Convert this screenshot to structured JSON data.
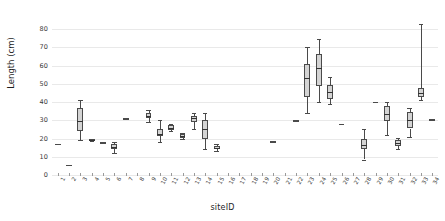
{
  "chart_data": {
    "type": "boxplot",
    "title": "",
    "xlabel": "siteID",
    "ylabel": "Length (cm)",
    "ylim": [
      0,
      85
    ],
    "yticks": [
      0,
      10,
      20,
      30,
      40,
      50,
      60,
      70,
      80
    ],
    "grid": true,
    "legend": null,
    "categories": [
      "1",
      "2",
      "3",
      "4",
      "5",
      "6",
      "7",
      "8",
      "9",
      "10",
      "11",
      "12",
      "13",
      "14",
      "15",
      "16",
      "17",
      "18",
      "19",
      "20",
      "21",
      "22",
      "23",
      "24",
      "25",
      "26",
      "27",
      "28",
      "29",
      "30",
      "31",
      "32",
      "33",
      "34"
    ],
    "boxes": [
      {
        "site": "1",
        "min": 17.0,
        "q1": 17.0,
        "median": 17.0,
        "q3": 17.0,
        "max": 17.0,
        "single": true
      },
      {
        "site": "2",
        "min": 5.5,
        "q1": 5.5,
        "median": 5.5,
        "q3": 5.5,
        "max": 5.5,
        "single": true
      },
      {
        "site": "3",
        "min": 19.0,
        "q1": 24.0,
        "median": 29.5,
        "q3": 36.5,
        "max": 41.0,
        "single": false
      },
      {
        "site": "4",
        "min": 18.5,
        "q1": 18.5,
        "median": 19.0,
        "q3": 19.5,
        "max": 19.5,
        "single": false
      },
      {
        "site": "5",
        "min": 18.0,
        "q1": 18.0,
        "median": 18.0,
        "q3": 18.0,
        "max": 18.0,
        "single": true
      },
      {
        "site": "6",
        "min": 12.0,
        "q1": 14.0,
        "median": 15.5,
        "q3": 17.0,
        "max": 18.0,
        "single": false
      },
      {
        "site": "7",
        "min": 31.0,
        "q1": 31.0,
        "median": 31.0,
        "q3": 31.0,
        "max": 31.0,
        "single": true
      },
      {
        "site": "8",
        "min": null,
        "q1": null,
        "median": null,
        "q3": null,
        "max": null,
        "single": false,
        "empty": true
      },
      {
        "site": "9",
        "min": 29.0,
        "q1": 31.0,
        "median": 32.5,
        "q3": 34.0,
        "max": 35.5,
        "single": false
      },
      {
        "site": "10",
        "min": 18.0,
        "q1": 21.5,
        "median": 22.5,
        "q3": 25.0,
        "max": 30.0,
        "single": false
      },
      {
        "site": "11",
        "min": 24.0,
        "q1": 24.5,
        "median": 26.0,
        "q3": 27.5,
        "max": 28.0,
        "single": false
      },
      {
        "site": "12",
        "min": 20.0,
        "q1": 20.5,
        "median": 21.5,
        "q3": 22.5,
        "max": 23.0,
        "single": false
      },
      {
        "site": "13",
        "min": 25.0,
        "q1": 29.0,
        "median": 31.5,
        "q3": 32.5,
        "max": 34.0,
        "single": false
      },
      {
        "site": "14",
        "min": 14.0,
        "q1": 20.0,
        "median": 25.0,
        "q3": 30.0,
        "max": 34.0,
        "single": false
      },
      {
        "site": "15",
        "min": 13.0,
        "q1": 14.0,
        "median": 15.0,
        "q3": 16.0,
        "max": 17.0,
        "single": false
      },
      {
        "site": "16",
        "min": null,
        "q1": null,
        "median": null,
        "q3": null,
        "max": null,
        "single": false,
        "empty": true
      },
      {
        "site": "17",
        "min": null,
        "q1": null,
        "median": null,
        "q3": null,
        "max": null,
        "single": false,
        "empty": true
      },
      {
        "site": "18",
        "min": null,
        "q1": null,
        "median": null,
        "q3": null,
        "max": null,
        "single": false,
        "empty": true
      },
      {
        "site": "19",
        "min": null,
        "q1": null,
        "median": null,
        "q3": null,
        "max": null,
        "single": false,
        "empty": true
      },
      {
        "site": "20",
        "min": 18.5,
        "q1": 18.5,
        "median": 18.5,
        "q3": 18.5,
        "max": 18.5,
        "single": true
      },
      {
        "site": "21",
        "min": null,
        "q1": null,
        "median": null,
        "q3": null,
        "max": null,
        "single": false,
        "empty": true
      },
      {
        "site": "22",
        "min": 30.0,
        "q1": 30.0,
        "median": 30.0,
        "q3": 30.0,
        "max": 30.0,
        "single": true
      },
      {
        "site": "23",
        "min": 34.0,
        "q1": 43.0,
        "median": 53.0,
        "q3": 61.0,
        "max": 70.0,
        "single": false
      },
      {
        "site": "24",
        "min": 40.0,
        "q1": 49.0,
        "median": 58.5,
        "q3": 66.5,
        "max": 74.5,
        "single": false
      },
      {
        "site": "25",
        "min": 39.0,
        "q1": 41.5,
        "median": 45.5,
        "q3": 49.5,
        "max": 54.0,
        "single": false
      },
      {
        "site": "26",
        "min": 28.0,
        "q1": 28.0,
        "median": 28.0,
        "q3": 28.0,
        "max": 28.0,
        "single": true
      },
      {
        "site": "27",
        "min": null,
        "q1": null,
        "median": null,
        "q3": null,
        "max": null,
        "single": false,
        "empty": true
      },
      {
        "site": "28",
        "min": 8.5,
        "q1": 14.0,
        "median": 16.5,
        "q3": 20.0,
        "max": 25.5,
        "single": false
      },
      {
        "site": "29",
        "min": 40.0,
        "q1": 40.0,
        "median": 40.0,
        "q3": 40.0,
        "max": 40.0,
        "single": true
      },
      {
        "site": "30",
        "min": 22.0,
        "q1": 29.5,
        "median": 33.5,
        "q3": 38.0,
        "max": 40.0,
        "single": false
      },
      {
        "site": "31",
        "min": 14.0,
        "q1": 16.0,
        "median": 17.5,
        "q3": 19.0,
        "max": 20.5,
        "single": false
      },
      {
        "site": "32",
        "min": 21.0,
        "q1": 25.5,
        "median": 30.0,
        "q3": 34.5,
        "max": 37.0,
        "single": false
      },
      {
        "site": "33",
        "min": 41.0,
        "q1": 43.0,
        "median": 45.0,
        "q3": 47.5,
        "max": 83.0,
        "single": false
      },
      {
        "site": "34",
        "min": 30.5,
        "q1": 30.5,
        "median": 30.5,
        "q3": 30.5,
        "max": 30.5,
        "single": true
      }
    ]
  }
}
